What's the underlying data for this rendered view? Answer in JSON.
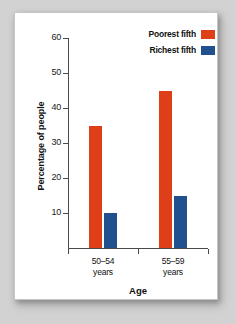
{
  "chart_data": {
    "type": "bar",
    "title": "",
    "xlabel": "Age",
    "ylabel": "Percentage of people",
    "categories": [
      "50–54 years",
      "55–59 years"
    ],
    "category_lines": [
      [
        "50–54",
        "years"
      ],
      [
        "55–59",
        "years"
      ]
    ],
    "series": [
      {
        "name": "Poorest fifth",
        "color": "#de3e18",
        "values": [
          35,
          45
        ]
      },
      {
        "name": "Richest fifth",
        "color": "#21508f",
        "values": [
          10,
          15
        ]
      }
    ],
    "ylim": [
      0,
      60
    ],
    "ytick_values": [
      10,
      20,
      30,
      40,
      50,
      60
    ],
    "ytick_labels": [
      "10",
      "20",
      "30",
      "40",
      "50",
      "60"
    ],
    "grid": false,
    "legend_position": "top-right"
  },
  "legend": {
    "entries": [
      {
        "label": "Poorest fifth",
        "color": "#de3e18"
      },
      {
        "label": "Richest fifth",
        "color": "#21508f"
      }
    ]
  },
  "colors": {
    "poorest": "#de3e18",
    "richest": "#21508f",
    "axis": "#4a4a4a",
    "card_background": "#ffffff",
    "page_background": "#d2d2d2",
    "text": "#111111"
  }
}
